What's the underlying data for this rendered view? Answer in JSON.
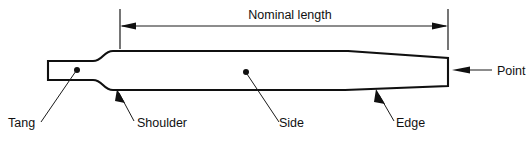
{
  "diagram": {
    "background_color": "#ffffff",
    "line_color": "#101010",
    "dimension": {
      "label": "Nominal length",
      "start_x": 120,
      "end_x": 448,
      "line_y": 26
    },
    "labels": [
      {
        "key": "tang",
        "text": "Tang",
        "x": 8,
        "y": 127
      },
      {
        "key": "shoulder",
        "text": "Shoulder",
        "x": 137,
        "y": 127
      },
      {
        "key": "side",
        "text": "Side",
        "x": 279,
        "y": 127
      },
      {
        "key": "edge",
        "text": "Edge",
        "x": 396,
        "y": 127
      },
      {
        "key": "point",
        "text": "Point",
        "x": 497,
        "y": 75
      }
    ]
  }
}
